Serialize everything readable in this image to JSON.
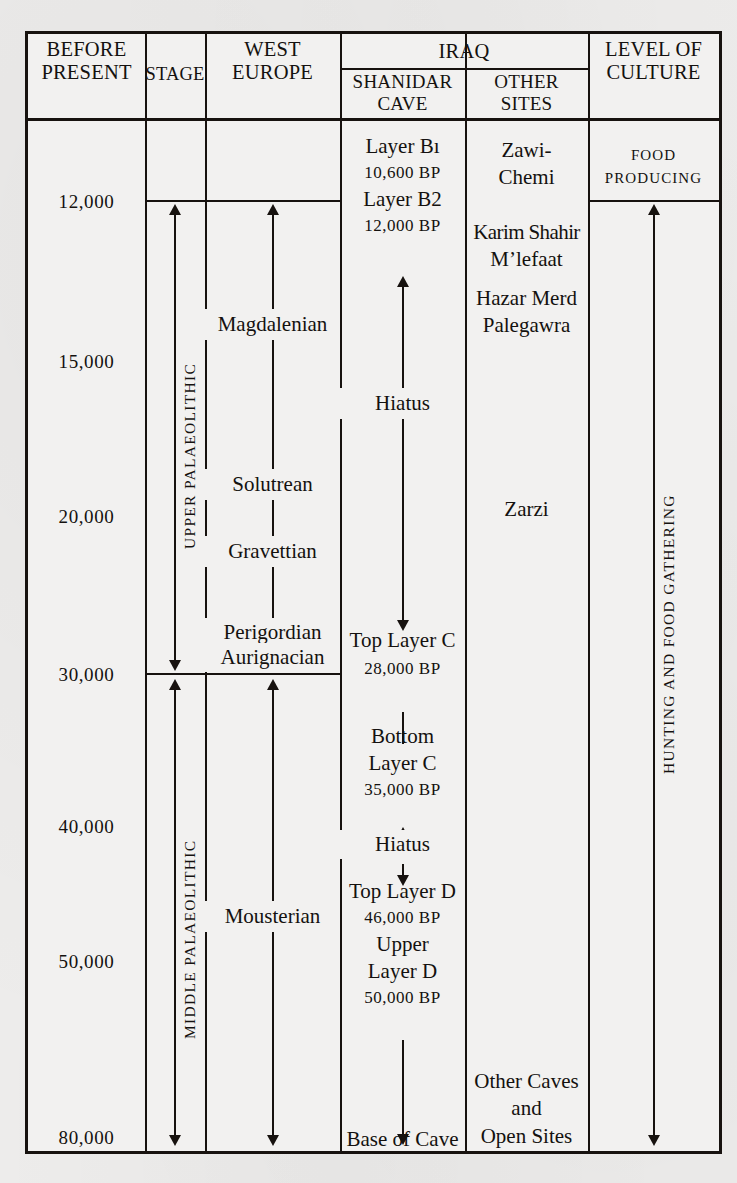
{
  "figure": {
    "type": "chronology-table"
  },
  "header": {
    "col_before_present": "BEFORE\nPRESENT",
    "col_before_present_line1": "BEFORE",
    "col_before_present_line2": "PRESENT",
    "col_stage": "STAGE",
    "col_west_europe_line1": "WEST",
    "col_west_europe_line2": "EUROPE",
    "col_iraq": "IRAQ",
    "col_shanidar_line1": "SHANIDAR",
    "col_shanidar_line2": "CAVE",
    "col_other_line1": "OTHER",
    "col_other_line2": "SITES",
    "col_level_line1": "LEVEL OF",
    "col_level_line2": "CULTURE"
  },
  "years": [
    {
      "label": "12,000",
      "y": 200
    },
    {
      "label": "15,000",
      "y": 360
    },
    {
      "label": "20,000",
      "y": 515
    },
    {
      "label": "30,000",
      "y": 673
    },
    {
      "label": "40,000",
      "y": 825
    },
    {
      "label": "50,000",
      "y": 960
    },
    {
      "label": "80,000",
      "y": 1136
    }
  ],
  "stage": {
    "upper": "UPPER PALAEOLITHIC",
    "middle": "MIDDLE PALAEOLITHIC"
  },
  "west_europe": {
    "industries": [
      {
        "name": "Magdalenian",
        "y": 318
      },
      {
        "name": "Solutrean",
        "y": 478
      },
      {
        "name": "Gravettian",
        "y": 545
      },
      {
        "name": "Perigordian",
        "y": 627
      },
      {
        "name": "Aurignacian",
        "y": 652
      },
      {
        "name": "Mousterian",
        "y": 910
      }
    ]
  },
  "shanidar_cave": {
    "entries": [
      {
        "text": "Layer Bı",
        "y": 143,
        "style": "body"
      },
      {
        "text": "10,600 BP",
        "y": 170,
        "style": "bp"
      },
      {
        "text": "Layer B2",
        "y": 196,
        "style": "body"
      },
      {
        "text": "12,000 BP",
        "y": 223,
        "style": "bp"
      },
      {
        "text": "Hiatus",
        "y": 398,
        "style": "body"
      },
      {
        "text": "Top Layer C",
        "y": 637,
        "style": "body"
      },
      {
        "text": "28,000 BP",
        "y": 666,
        "style": "bp"
      },
      {
        "text": "Bottom",
        "y": 733,
        "style": "body"
      },
      {
        "text": "Layer C",
        "y": 760,
        "style": "body"
      },
      {
        "text": "35,000 BP",
        "y": 787,
        "style": "bp"
      },
      {
        "text": "Hiatus",
        "y": 839,
        "style": "body"
      },
      {
        "text": "Top Layer D",
        "y": 888,
        "style": "body"
      },
      {
        "text": "46,000 BP",
        "y": 915,
        "style": "bp"
      },
      {
        "text": "Upper",
        "y": 941,
        "style": "body"
      },
      {
        "text": "Layer D",
        "y": 968,
        "style": "body"
      },
      {
        "text": "50,000 BP",
        "y": 995,
        "style": "bp"
      },
      {
        "text": "Base of Cave",
        "y": 1136,
        "style": "body"
      }
    ]
  },
  "other_sites": {
    "entries": [
      {
        "text": "Zawi-",
        "y": 147
      },
      {
        "text": "Chemi",
        "y": 174
      },
      {
        "text": "Karim Shahir",
        "y": 229
      },
      {
        "text": "M’lefaat",
        "y": 256
      },
      {
        "text": "Hazar Merd",
        "y": 295
      },
      {
        "text": "Palegawra",
        "y": 322
      },
      {
        "text": "Zarzi",
        "y": 506
      },
      {
        "text": "Other Caves",
        "y": 1078
      },
      {
        "text": "and",
        "y": 1105
      },
      {
        "text": "Open Sites",
        "y": 1133
      }
    ]
  },
  "level_of_culture": {
    "food_producing_line1": "FOOD",
    "food_producing_line2": "PRODUCING",
    "hunting_gathering": "HUNTING AND FOOD GATHERING"
  },
  "colors": {
    "ink": "#17120f",
    "paper": "#edeceb",
    "cell_paper": "#f2f1f0"
  }
}
